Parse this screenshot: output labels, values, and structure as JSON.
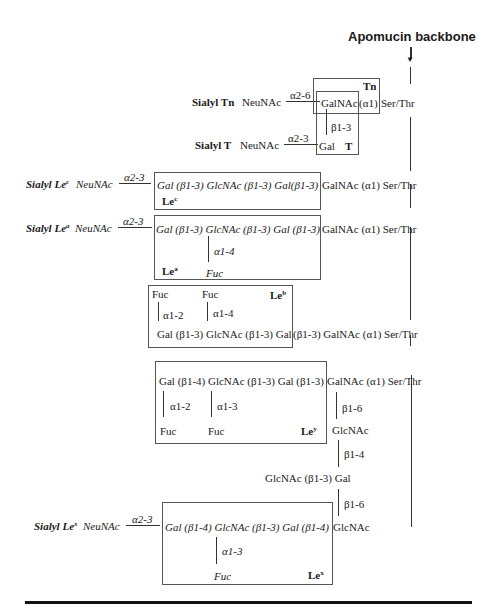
{
  "title": "Apomucin backbone",
  "structures": {
    "sialyl_tn": {
      "label": "Sialyl Tn",
      "neunac": "NeuNAc",
      "link": "α2-6",
      "core": "GalNAc",
      "anomeric": "(α1)",
      "aa": "Ser/Thr",
      "box_label": "Tn"
    },
    "sialyl_t": {
      "label": "Sialyl T",
      "neunac": "NeuNAc",
      "link": "α2-3",
      "sugar": "Gal",
      "branch": "β1-3",
      "box_label": "T"
    },
    "sialyl_lec": {
      "label": "Sialyl Le",
      "sup": "c",
      "neunac": "NeuNAc",
      "link": "α2-3",
      "chain": "Gal (β1-3) GlcNAc (β1-3) Gal(β1-3)",
      "tail": "GalNAc (α1) Ser/Thr",
      "box_label": "Le",
      "box_sup": "c"
    },
    "sialyl_lea": {
      "label": "Sialyl Le",
      "sup": "a",
      "neunac": "NeuNAc",
      "link": "α2-3",
      "chain": "Gal (β1-3) GlcNAc (β1-3) Gal (β1-3)",
      "tail": "GalNAc (α1) Ser/Thr",
      "branch": "α1-4",
      "fuc": "Fuc",
      "box_label": "Le",
      "box_sup": "a"
    },
    "leb": {
      "fuc1": "Fuc",
      "fuc2": "Fuc",
      "branch1": "α1-2",
      "branch2": "α1-4",
      "chain": "Gal (β1-3) GlcNAc (β1-3) Gal",
      "tail": "(β1-3) GalNAc (α1) Ser/Thr",
      "box_label": "Le",
      "box_sup": "b"
    },
    "ley": {
      "chain": "Gal (β1-4) GlcNAc (β1-3) Gal (β1-3)",
      "tail": "GalNAc (α1) Ser/Thr",
      "branch1": "α1-2",
      "branch2": "α1-3",
      "fuc1": "Fuc",
      "fuc2": "Fuc",
      "box_label": "Le",
      "box_sup": "y",
      "b16": "β1-6",
      "glcnac": "GlcNAc",
      "b14": "β1-4",
      "glcnac_gal": "GlcNAc (β1-3) Gal",
      "b16b": "β1-6"
    },
    "sialyl_lex": {
      "label": "Sialyl Le",
      "sup": "x",
      "neunac": "NeuNAc",
      "link": "α2-3",
      "chain": "Gal (β1-4) GlcNAc (β1-3) Gal (β1-4)",
      "tail": "GlcNAc",
      "branch": "α1-3",
      "fuc": "Fuc",
      "box_label": "Le",
      "box_sup": "x"
    }
  }
}
